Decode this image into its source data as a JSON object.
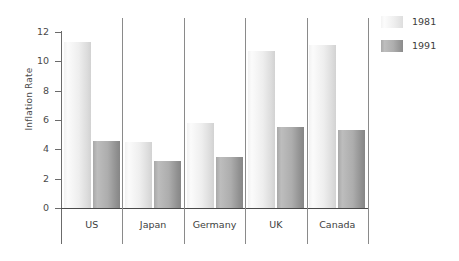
{
  "chart_data": {
    "type": "bar",
    "title": "",
    "xlabel": "",
    "ylabel": "Inflation Rate",
    "categories": [
      "US",
      "Japan",
      "Germany",
      "UK",
      "Canada"
    ],
    "series": [
      {
        "name": "1981",
        "color": "#ededed",
        "values": [
          11.3,
          4.5,
          5.8,
          10.7,
          11.1
        ]
      },
      {
        "name": "1991",
        "color": "#a5a5a5",
        "values": [
          4.6,
          3.2,
          3.45,
          5.5,
          5.3
        ]
      }
    ],
    "ylim": [
      0,
      12
    ],
    "yticks": [
      0,
      2,
      4,
      6,
      8,
      10,
      12
    ],
    "ytick_labels": [
      "0",
      "2",
      "4",
      "6",
      "8",
      "10",
      "12"
    ],
    "grid": false,
    "legend_position": "right",
    "group_separators": true
  },
  "legend": {
    "entries": [
      {
        "label": "1981"
      },
      {
        "label": "1991"
      }
    ]
  },
  "axes": {
    "y_title": "Inflation Rate"
  }
}
